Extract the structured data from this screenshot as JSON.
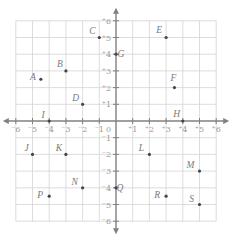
{
  "chart_data": {
    "type": "scatter",
    "title": "",
    "xlabel": "",
    "ylabel": "",
    "xlim": [
      -6,
      6
    ],
    "ylim": [
      -6,
      6
    ],
    "grid": true,
    "x_ticks": [
      -6,
      -5,
      -4,
      -3,
      -2,
      -1,
      1,
      2,
      3,
      4,
      5,
      6
    ],
    "y_ticks": [
      -6,
      -5,
      -4,
      -3,
      -2,
      -1,
      1,
      2,
      3,
      4,
      5,
      6
    ],
    "origin_label": "0",
    "points": [
      {
        "label": "A",
        "x": -4.5,
        "y": 2.5
      },
      {
        "label": "B",
        "x": -3,
        "y": 3
      },
      {
        "label": "C",
        "x": -1,
        "y": 5
      },
      {
        "label": "D",
        "x": -2,
        "y": 1
      },
      {
        "label": "E",
        "x": 3,
        "y": 5
      },
      {
        "label": "F",
        "x": 3.5,
        "y": 2
      },
      {
        "label": "G",
        "x": 0,
        "y": 4
      },
      {
        "label": "H",
        "x": 4,
        "y": 0
      },
      {
        "label": "I",
        "x": -4,
        "y": 0
      },
      {
        "label": "J",
        "x": -5,
        "y": -2
      },
      {
        "label": "K",
        "x": -3,
        "y": -2
      },
      {
        "label": "L",
        "x": 2,
        "y": -2
      },
      {
        "label": "M",
        "x": 5,
        "y": -3
      },
      {
        "label": "N",
        "x": -2,
        "y": -4
      },
      {
        "label": "P",
        "x": -4,
        "y": -4.5
      },
      {
        "label": "Q",
        "x": 0,
        "y": -4
      },
      {
        "label": "R",
        "x": 3,
        "y": -4.5
      },
      {
        "label": "S",
        "x": 5,
        "y": -5
      }
    ]
  },
  "colors": {
    "grid": "#d4d4d4",
    "axis": "#808080",
    "point": "#444444",
    "label": "#7a7a7a"
  }
}
